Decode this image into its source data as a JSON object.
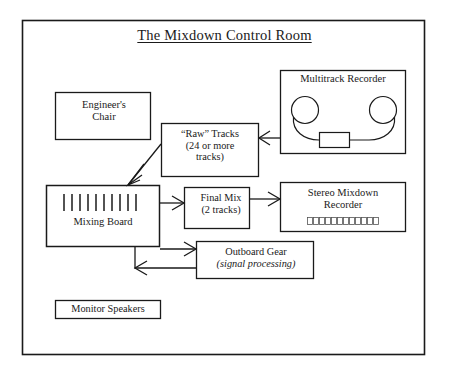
{
  "page": {
    "title": "The Mixdown Control Room",
    "title_underlined": true,
    "background_color": "#ffffff",
    "ink_color": "#1a1a1a"
  },
  "diagram": {
    "type": "block-flow-diagram",
    "outer_frame": {
      "name": "control-room-frame",
      "x": 22,
      "y": 20,
      "width": 403,
      "height": 335
    },
    "boxes": [
      {
        "id": "engineer-chair",
        "label": "Engineer's\nChair",
        "line1": "Engineer's",
        "line2": "Chair",
        "x": 55,
        "y": 92,
        "width": 96,
        "height": 48
      },
      {
        "id": "raw-tracks",
        "label": "“Raw” Tracks (24 or more tracks)",
        "line1": "“Raw” Tracks",
        "line2": "(24 or more",
        "line3": "tracks)",
        "x": 161,
        "y": 123,
        "width": 98,
        "height": 54
      },
      {
        "id": "multitrack-recorder",
        "label": "Multitrack Recorder",
        "line1": "Multitrack Recorder",
        "x": 280,
        "y": 70,
        "width": 126,
        "height": 84,
        "graphic": "reel-to-reel-tape-deck"
      },
      {
        "id": "mixing-board",
        "label": "Mixing Board",
        "line1": "Mixing Board",
        "x": 46,
        "y": 185,
        "width": 114,
        "height": 62,
        "graphic": "fader-strip",
        "fader_count": 10
      },
      {
        "id": "final-mix",
        "label": "Final Mix (2 tracks)",
        "line1": "Final Mix",
        "line2": "(2 tracks)",
        "x": 184,
        "y": 187,
        "width": 66,
        "height": 42
      },
      {
        "id": "stereo-mixdown-recorder",
        "label": "Stereo Mixdown Recorder",
        "line1": "Stereo Mixdown",
        "line2": "Recorder",
        "x": 280,
        "y": 182,
        "width": 126,
        "height": 50,
        "graphic": "led-meter-segments",
        "segment_count": 12
      },
      {
        "id": "outboard-gear",
        "label": "Outboard Gear (signal processing)",
        "line1": "Outboard  Gear",
        "line2": "(signal  processing)",
        "x": 196,
        "y": 241,
        "width": 118,
        "height": 38
      },
      {
        "id": "monitor-speakers",
        "label": "Monitor Speakers",
        "line1": "Monitor Speakers",
        "x": 55,
        "y": 300,
        "width": 106,
        "height": 19
      }
    ],
    "connectors": [
      {
        "id": "multitrack-to-raw-tracks",
        "from": "multitrack-recorder",
        "to": "raw-tracks",
        "direction": "left",
        "style": "open-arrow"
      },
      {
        "id": "raw-tracks-to-mixing-board",
        "from": "raw-tracks",
        "to": "mixing-board",
        "direction": "down-left",
        "style": "open-arrow-diagonal"
      },
      {
        "id": "mixing-board-to-final-mix",
        "from": "mixing-board",
        "to": "final-mix",
        "direction": "right",
        "style": "open-arrow"
      },
      {
        "id": "final-mix-to-stereo-recorder",
        "from": "final-mix",
        "to": "stereo-mixdown-recorder",
        "direction": "right",
        "style": "open-arrow"
      },
      {
        "id": "mixing-board-to-outboard-gear",
        "from": "mixing-board",
        "to": "outboard-gear",
        "direction": "right",
        "style": "open-arrow"
      },
      {
        "id": "outboard-gear-return-to-mixing-board",
        "from": "outboard-gear",
        "to": "mixing-board",
        "direction": "left-then-up",
        "style": "open-arrow-elbow"
      }
    ]
  },
  "labels": {
    "engineer_chair_l1": "Engineer's",
    "engineer_chair_l2": "Chair",
    "raw_tracks_l1": "“Raw” Tracks",
    "raw_tracks_l2": "(24 or more",
    "raw_tracks_l3": "tracks)",
    "multitrack_recorder": "Multitrack Recorder",
    "mixing_board": "Mixing Board",
    "final_mix_l1": "Final Mix",
    "final_mix_l2": "(2 tracks)",
    "stereo_recorder_l1": "Stereo Mixdown",
    "stereo_recorder_l2": "Recorder",
    "outboard_gear_l1": "Outboard  Gear",
    "outboard_gear_l2": "(signal  processing)",
    "monitor_speakers": "Monitor Speakers"
  }
}
